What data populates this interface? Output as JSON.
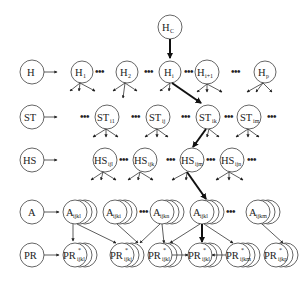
{
  "diagram": {
    "type": "hierarchical-tree",
    "root": {
      "label": "H",
      "sub": "C"
    },
    "levels": [
      {
        "key": "H",
        "label": "H",
        "nodes": [
          {
            "label": "H",
            "sub": "1"
          },
          {
            "label": "H",
            "sub": "2"
          },
          {
            "label": "H",
            "sub": "i"
          },
          {
            "label": "H",
            "sub": "i+1"
          },
          {
            "label": "H",
            "sub": "p"
          }
        ]
      },
      {
        "key": "ST",
        "label": "ST",
        "nodes": [
          {
            "label": "ST",
            "sub": "i1"
          },
          {
            "label": "ST",
            "sub": "ij"
          },
          {
            "label": "ST",
            "sub": "ik"
          },
          {
            "label": "ST",
            "sub": "im"
          }
        ]
      },
      {
        "key": "HS",
        "label": "HS",
        "nodes": [
          {
            "label": "HS",
            "sub": "ijl"
          },
          {
            "label": "HS",
            "sub": "ijk"
          },
          {
            "label": "HS",
            "sub": "ijm"
          },
          {
            "label": "HS",
            "sub": "ijn"
          }
        ]
      },
      {
        "key": "A",
        "label": "A",
        "nodes": [
          {
            "label": "A",
            "sub": "ijkl"
          },
          {
            "label": "A",
            "sub": "ijki"
          },
          {
            "label": "A",
            "sub": "ijkn"
          },
          {
            "label": "A",
            "sub": "ijkl"
          },
          {
            "label": "A",
            "sub": "ijkm"
          }
        ]
      },
      {
        "key": "PR",
        "label": "PR",
        "nodes": [
          {
            "label": "PR",
            "sup": "*",
            "sub": "ijkl"
          },
          {
            "label": "PR",
            "sup": "*",
            "sub": "ijkj"
          },
          {
            "label": "PR",
            "sup": "*",
            "sub": "ijkl"
          },
          {
            "label": "PR",
            "sup": "*",
            "sub": "ijkl"
          },
          {
            "label": "PR",
            "sup": "*",
            "sub": "ijkm"
          },
          {
            "label": "PR",
            "sup": "*",
            "sub": "ijkp"
          }
        ]
      }
    ],
    "ellipsis": "•••"
  }
}
